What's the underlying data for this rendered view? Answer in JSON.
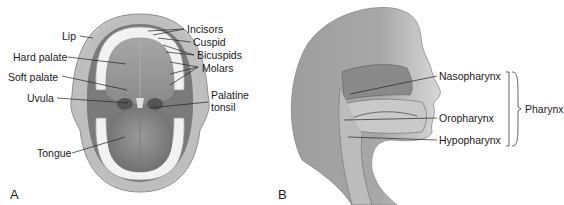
{
  "figure": {
    "panels": [
      {
        "id": "A",
        "letter": "A",
        "subject": "open-mouth-oral-cavity",
        "labels": {
          "lip": "Lip",
          "hard_palate": "Hard palate",
          "soft_palate": "Soft palate",
          "uvula": "Uvula",
          "tongue": "Tongue",
          "incisors": "Incisors",
          "cuspid": "Cuspid",
          "bicuspids": "Bicuspids",
          "molars": "Molars",
          "palatine_tonsil_line1": "Palatine",
          "palatine_tonsil_line2": "tonsil"
        }
      },
      {
        "id": "B",
        "letter": "B",
        "subject": "head-sagittal-section-pharynx",
        "labels": {
          "nasopharynx": "Nasopharynx",
          "oropharynx": "Oropharynx",
          "hypopharynx": "Hypopharynx",
          "pharynx": "Pharynx"
        }
      }
    ],
    "colors": {
      "skin": "#b8b8b8",
      "lip": "#cfcfcf",
      "palate": "#9a9a9a",
      "tongue": "#8e8e8e",
      "teeth": "#f2f2f2",
      "label_text": "#1a1a1a",
      "leader_line": "#222222"
    }
  }
}
